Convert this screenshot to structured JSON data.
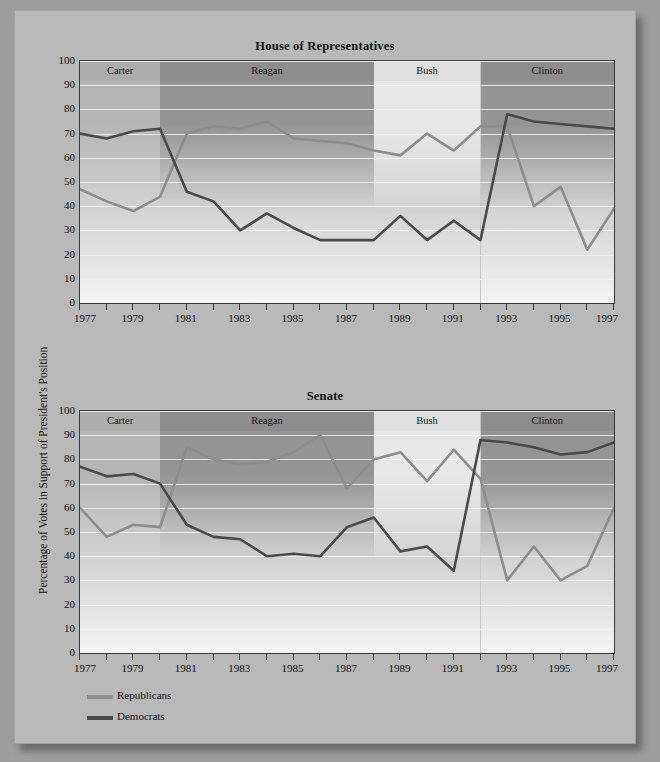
{
  "figure": {
    "y_axis_title": "Percentage of Votes in Support of President's Position",
    "background_color": "#9e9e9e",
    "page_color": "#b9b9b9"
  },
  "legend": {
    "position": "bottom-left",
    "items": [
      {
        "label": "Republicans",
        "color": "#8d8d8d"
      },
      {
        "label": "Democrats",
        "color": "#4a4a4a"
      }
    ]
  },
  "eras": [
    {
      "name": "Carter",
      "start": 1977,
      "end": 1980,
      "shade": "#b5b5b5"
    },
    {
      "name": "Reagan",
      "start": 1980,
      "end": 1988,
      "shade": "#949494"
    },
    {
      "name": "Bush",
      "start": 1988,
      "end": 1992,
      "shade": "#e8e8e8"
    },
    {
      "name": "Clinton",
      "start": 1992,
      "end": 1997,
      "shade": "#949494"
    }
  ],
  "axis": {
    "y_ticks": [
      0,
      10,
      20,
      30,
      40,
      50,
      60,
      70,
      80,
      90,
      100
    ],
    "x_ticks": [
      1977,
      1978,
      1979,
      1980,
      1981,
      1982,
      1983,
      1984,
      1985,
      1986,
      1987,
      1988,
      1989,
      1990,
      1991,
      1992,
      1993,
      1994,
      1995,
      1996,
      1997
    ],
    "x_labels": [
      1977,
      1979,
      1981,
      1983,
      1985,
      1987,
      1989,
      1991,
      1993,
      1995,
      1997
    ]
  },
  "chart_data": [
    {
      "type": "line",
      "title": "House of Representatives",
      "xlabel": "",
      "ylabel": "Percentage of Votes in Support of President's Position",
      "xlim": [
        1977,
        1997
      ],
      "ylim": [
        0,
        100
      ],
      "grid": true,
      "legend_position": "below-figure",
      "x": [
        1977,
        1978,
        1979,
        1980,
        1981,
        1982,
        1983,
        1984,
        1985,
        1986,
        1987,
        1988,
        1989,
        1990,
        1991,
        1992,
        1993,
        1994,
        1995,
        1996,
        1997
      ],
      "series": [
        {
          "name": "Republicans",
          "color": "#8d8d8d",
          "values": [
            47,
            42,
            38,
            44,
            70,
            73,
            72,
            75,
            68,
            67,
            66,
            63,
            61,
            70,
            63,
            73,
            73,
            40,
            48,
            22,
            39,
            30
          ]
        },
        {
          "name": "Democrats",
          "color": "#4a4a4a",
          "values": [
            70,
            68,
            71,
            72,
            46,
            42,
            30,
            37,
            31,
            26,
            26,
            26,
            36,
            26,
            34,
            26,
            78,
            75,
            74,
            73,
            72,
            72
          ]
        }
      ]
    },
    {
      "type": "line",
      "title": "Senate",
      "xlabel": "",
      "ylabel": "Percentage of Votes in Support of President's Position",
      "xlim": [
        1977,
        1997
      ],
      "ylim": [
        0,
        100
      ],
      "grid": true,
      "legend_position": "below-figure",
      "x": [
        1977,
        1978,
        1979,
        1980,
        1981,
        1982,
        1983,
        1984,
        1985,
        1986,
        1987,
        1988,
        1989,
        1990,
        1991,
        1992,
        1993,
        1994,
        1995,
        1996,
        1997
      ],
      "series": [
        {
          "name": "Republicans",
          "color": "#8d8d8d",
          "values": [
            60,
            48,
            53,
            52,
            85,
            80,
            78,
            79,
            83,
            90,
            68,
            80,
            83,
            71,
            84,
            72,
            30,
            44,
            30,
            36,
            60
          ]
        },
        {
          "name": "Democrats",
          "color": "#4a4a4a",
          "values": [
            77,
            73,
            74,
            70,
            53,
            48,
            47,
            40,
            41,
            40,
            52,
            56,
            42,
            44,
            34,
            88,
            87,
            85,
            82,
            83,
            87
          ]
        }
      ]
    }
  ]
}
